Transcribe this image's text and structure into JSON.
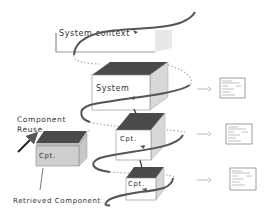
{
  "labels": {
    "system_context": "System context",
    "system": "System",
    "cpt_mid": "Cpt.",
    "cpt_low": "Cpt.",
    "cpt_retrieved": "Cpt.",
    "component_reuse_line1": "Component",
    "component_reuse_line2": "Reuse",
    "retrieved_component": "Retrieved Component"
  },
  "colors": {
    "box_top": "#4a4a4a",
    "box_front": "#ffffff",
    "box_side": "#d8d8d8",
    "retrieved_front": "#cfcfcf",
    "spiral": "#555555",
    "dotted": "#9a9a9a",
    "doc_border": "#8a8a8a"
  },
  "documents": [
    {
      "name": "system-spec-doc"
    },
    {
      "name": "component-spec-doc-1"
    },
    {
      "name": "component-spec-doc-2"
    }
  ]
}
